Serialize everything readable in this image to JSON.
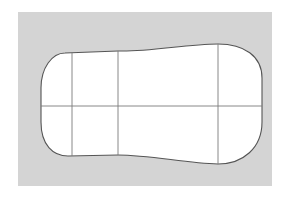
{
  "canvas": {
    "width": 285,
    "height": 203,
    "background_color": "#ffffff"
  },
  "panel": {
    "name": "gray-backdrop-panel",
    "x": 18,
    "y": 12,
    "width": 254,
    "height": 174,
    "fill_color": "#d4d4d4"
  },
  "shape": {
    "name": "curved-blob-outline",
    "fill_color": "#ffffff",
    "stroke_color": "#555555",
    "stroke_width": 1.1,
    "description": "rounded hourglass / guitar-body outline",
    "bounds": {
      "left": 41,
      "right": 262,
      "top": 44,
      "bottom": 164
    },
    "path": "M 65 53 C 52 53 41 68 41 88 L 41 122 C 41 145 53 156 68 156 L 118 155 C 150 155 185 163 218 164 C 243 164 262 148 262 122 L 262 78 C 262 56 244 44 218 44 C 186 44 150 52 118 51 Z"
  },
  "grid": {
    "name": "shape-grid-lines",
    "stroke_color": "#7a7a7a",
    "stroke_width": 0.9,
    "vertical_lines": [
      {
        "name": "vertical-line-left",
        "x": 72,
        "y1": 53,
        "y2": 156
      },
      {
        "name": "vertical-line-center",
        "x": 118,
        "y1": 51,
        "y2": 155
      },
      {
        "name": "vertical-line-right",
        "x": 218,
        "y1": 44,
        "y2": 164
      }
    ],
    "horizontal_lines": [
      {
        "name": "horizontal-midline",
        "y": 106,
        "x1": 41,
        "x2": 262
      }
    ]
  }
}
